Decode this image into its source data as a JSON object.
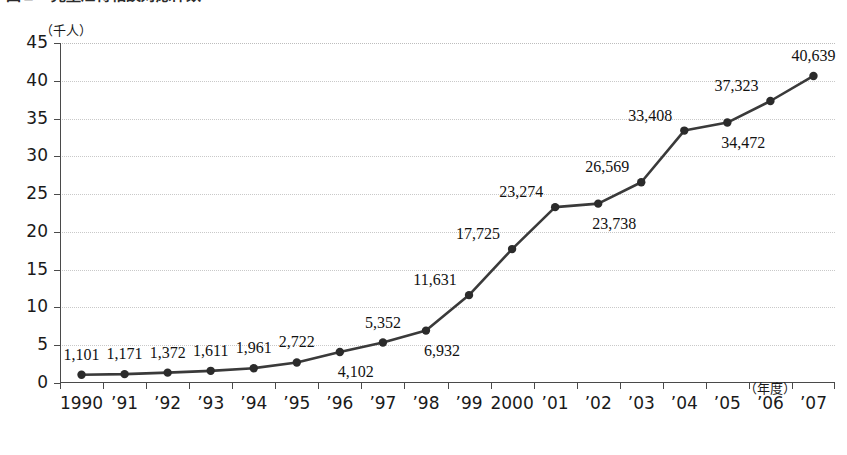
{
  "figure": {
    "title": "図２　児童虐待相談対応件数",
    "unit_label": "（千人）",
    "xaxis_unit": "（年度）"
  },
  "chart_data": {
    "type": "line",
    "title": "図２　児童虐待相談対応件数",
    "xlabel": "（年度）",
    "ylabel": "（千人）",
    "ylim": [
      0,
      45
    ],
    "ytick_step": 5,
    "yticks": [
      "0",
      "5",
      "10",
      "15",
      "20",
      "25",
      "30",
      "35",
      "40",
      "45"
    ],
    "grid": true,
    "legend": "none",
    "categories": [
      "1990",
      "’91",
      "’92",
      "’93",
      "’94",
      "’95",
      "’96",
      "’97",
      "’98",
      "’99",
      "2000",
      "’01",
      "’02",
      "’03",
      "’04",
      "’05",
      "’06",
      "’07"
    ],
    "values": [
      1101,
      1171,
      1372,
      1611,
      1961,
      2722,
      4102,
      5352,
      6932,
      11631,
      17725,
      23274,
      23738,
      26569,
      33408,
      34472,
      37323,
      40639
    ],
    "value_labels": [
      "1,101",
      "1,171",
      "1,372",
      "1,611",
      "1,961",
      "2,722",
      "4,102",
      "5,352",
      "6,932",
      "11,631",
      "17,725",
      "23,274",
      "23,738",
      "26,569",
      "33,408",
      "34,472",
      "37,323",
      "40,639"
    ],
    "label_positions": [
      "above",
      "above",
      "above",
      "above",
      "above",
      "above",
      "below",
      "above",
      "below",
      "left-above",
      "left-above",
      "left-above",
      "below",
      "left-above",
      "left-above",
      "below",
      "left-above",
      "above"
    ],
    "series_color": "#3a3a3a",
    "marker": "circle",
    "marker_color": "#2b2b2b"
  }
}
